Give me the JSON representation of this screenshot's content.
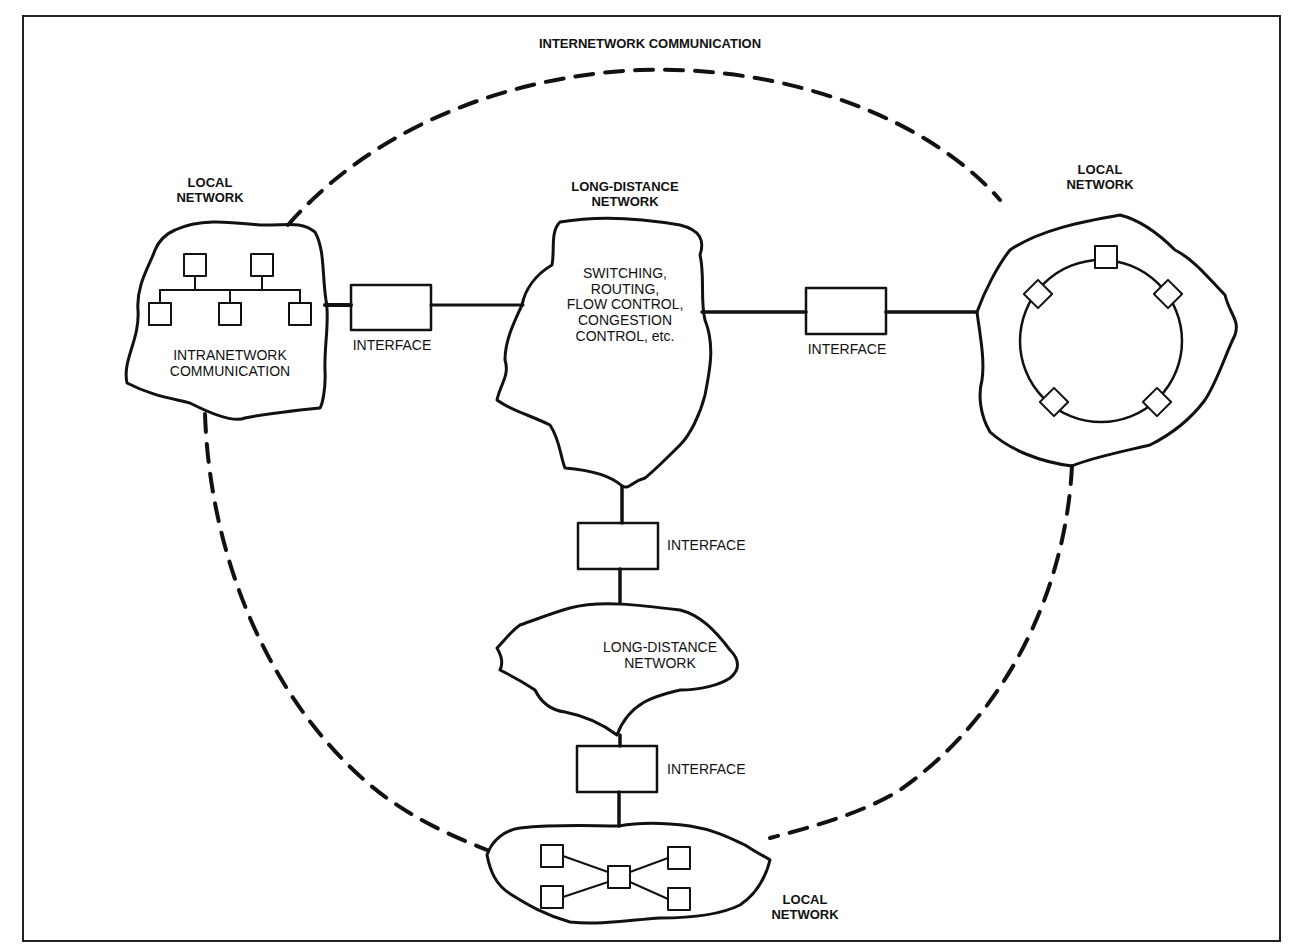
{
  "figure": {
    "title": "INTERNETWORK COMMUNICATION",
    "nodes": {
      "local_network_left": {
        "label": "LOCAL\nNETWORK",
        "inner_label": "INTRANETWORK\nCOMMUNICATION",
        "topology": "bus",
        "station_count": 5
      },
      "long_distance_top": {
        "label": "LONG-DISTANCE\nNETWORK",
        "inner_label": "SWITCHING,\nROUTING,\nFLOW CONTROL,\nCONGESTION\nCONTROL, etc."
      },
      "local_network_right": {
        "label": "LOCAL\nNETWORK",
        "topology": "ring",
        "station_count": 5
      },
      "long_distance_bottom": {
        "inner_label": "LONG-DISTANCE\nNETWORK"
      },
      "local_network_bottom": {
        "label": "LOCAL\nNETWORK",
        "topology": "star",
        "station_count": 5
      }
    },
    "interfaces": [
      {
        "id": "left",
        "label": "INTERFACE"
      },
      {
        "id": "right",
        "label": "INTERFACE"
      },
      {
        "id": "middle",
        "label": "INTERFACE"
      },
      {
        "id": "bottom",
        "label": "INTERFACE"
      }
    ],
    "colors": {
      "ink": "#111111",
      "background": "#ffffff"
    }
  }
}
